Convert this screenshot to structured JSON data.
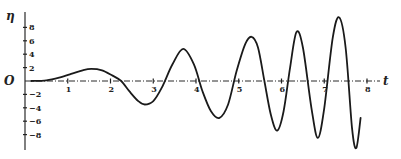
{
  "chart_data": {
    "type": "line",
    "title": "",
    "xlabel": "t",
    "ylabel": "η",
    "origin_label": "O",
    "xlim": [
      0,
      8.3
    ],
    "ylim": [
      -10.5,
      9.5
    ],
    "grid": false,
    "legend": null,
    "x_ticks": [
      1,
      2,
      3,
      4,
      5,
      6,
      7,
      8
    ],
    "x_tick_labels": [
      "1",
      "2",
      "3",
      "4",
      "5",
      "6",
      "7",
      "8"
    ],
    "y_ticks": [
      8,
      6,
      4,
      2,
      -2,
      -4,
      -6,
      -8
    ],
    "y_tick_labels": [
      "8",
      "6",
      "4",
      "2",
      "−2",
      "−4",
      "−6",
      "−8"
    ],
    "series": [
      {
        "name": "η(t)",
        "x": [
          0.15,
          0.5,
          0.8,
          1.1,
          1.35,
          1.55,
          1.8,
          2.05,
          2.25,
          2.45,
          2.65,
          2.8,
          3.0,
          3.2,
          3.45,
          3.7,
          3.95,
          4.15,
          4.35,
          4.55,
          4.75,
          4.95,
          5.15,
          5.3,
          5.45,
          5.6,
          5.75,
          5.9,
          6.05,
          6.2,
          6.35,
          6.5,
          6.7,
          6.85,
          7.0,
          7.2,
          7.35,
          7.5,
          7.65,
          7.75,
          7.85
        ],
        "y": [
          0.0,
          0.1,
          0.5,
          1.1,
          1.6,
          1.8,
          1.6,
          0.8,
          0.0,
          -1.6,
          -3.0,
          -3.5,
          -3.0,
          -1.0,
          2.5,
          4.8,
          2.5,
          -1.5,
          -4.5,
          -5.5,
          -3.5,
          1.5,
          5.5,
          6.6,
          5.0,
          0.0,
          -5.0,
          -7.4,
          -4.5,
          2.0,
          7.3,
          5.0,
          -4.0,
          -8.5,
          -4.0,
          6.5,
          9.5,
          5.0,
          -7.0,
          -10.0,
          -5.5
        ]
      }
    ]
  },
  "layout": {
    "origin_px": [
      25,
      81
    ],
    "px_per_x_unit": 42.75,
    "px_per_y_unit": 6.7,
    "x_axis_end_px": 380,
    "y_axis_top_px": 12,
    "y_axis_bottom_px": 150
  }
}
